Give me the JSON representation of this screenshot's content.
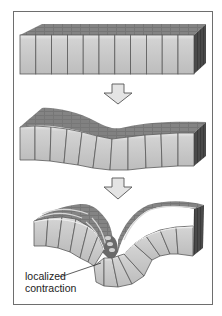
{
  "figure": {
    "stages": [
      {
        "id": "stage-1",
        "name": "flat-epithelial-sheet",
        "cell_count": 11
      },
      {
        "id": "stage-2",
        "name": "bending-epithelial-sheet",
        "cell_count": 11
      },
      {
        "id": "stage-3",
        "name": "folded-epithelial-sheet",
        "cell_count": 11
      }
    ],
    "arrows": [
      {
        "id": "arrow-1",
        "direction": "down"
      },
      {
        "id": "arrow-2",
        "direction": "down"
      }
    ],
    "annotation": {
      "line1": "localized",
      "line2": "contraction"
    },
    "colors": {
      "frame": "#6e6e6e",
      "cell_front": "#c8c8c8",
      "cell_highlight": "#e6e6e6",
      "cell_top": "#707070",
      "cell_top_light": "#8c8c8c",
      "cell_side": "#3c3c3c",
      "cell_edge": "#5a5a5a",
      "arrow_fill": "#e4e4e4",
      "arrow_stroke": "#555555"
    }
  }
}
